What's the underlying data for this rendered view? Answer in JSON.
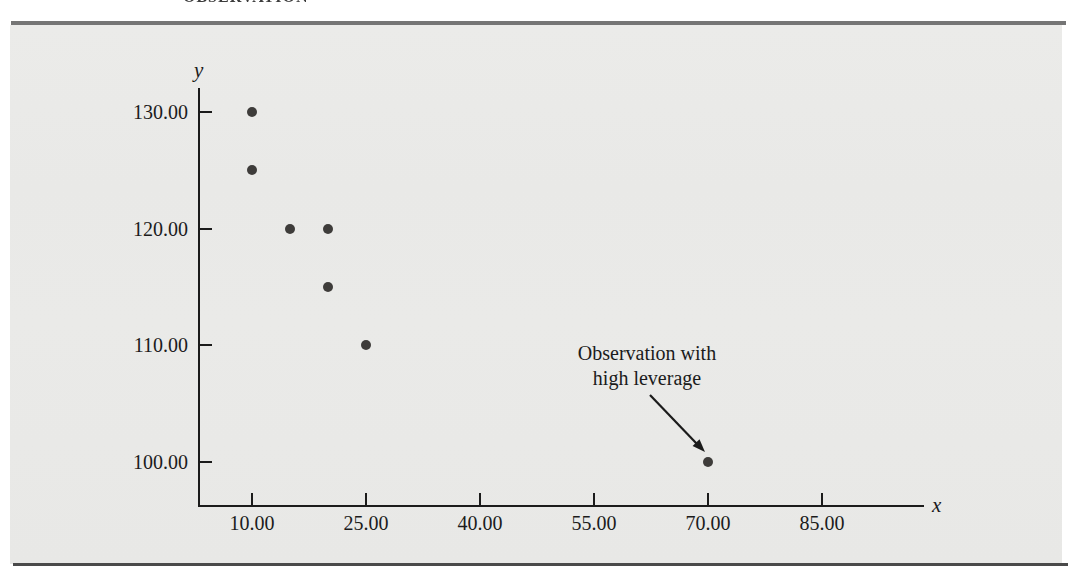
{
  "page": {
    "clipped_header_text": "OBSERVATION"
  },
  "figure": {
    "panel_background_color": "#e9e9e7",
    "top_bar_color": "#757575",
    "bottom_rule_color": "#4a4a4a",
    "axis_color": "#1b1b1b",
    "point_color": "#3e3c3a"
  },
  "chart_data": {
    "type": "scatter",
    "title": "",
    "xlabel": "x",
    "ylabel": "y",
    "grid": false,
    "legend": false,
    "xlim": [
      2,
      97
    ],
    "ylim": [
      96,
      133
    ],
    "x_ticks": [
      {
        "value": 10,
        "label": "10.00"
      },
      {
        "value": 25,
        "label": "25.00"
      },
      {
        "value": 40,
        "label": "40.00"
      },
      {
        "value": 55,
        "label": "55.00"
      },
      {
        "value": 70,
        "label": "70.00"
      },
      {
        "value": 85,
        "label": "85.00"
      }
    ],
    "y_ticks": [
      {
        "value": 100,
        "label": "100.00"
      },
      {
        "value": 110,
        "label": "110.00"
      },
      {
        "value": 120,
        "label": "120.00"
      },
      {
        "value": 130,
        "label": "130.00"
      }
    ],
    "points": [
      {
        "x": 10,
        "y": 130
      },
      {
        "x": 10,
        "y": 125
      },
      {
        "x": 15,
        "y": 120
      },
      {
        "x": 20,
        "y": 120
      },
      {
        "x": 20,
        "y": 115
      },
      {
        "x": 25,
        "y": 110
      },
      {
        "x": 70,
        "y": 100
      }
    ],
    "annotation": {
      "text_line1": "Observation with",
      "text_line2": "high leverage",
      "points_to": {
        "x": 70,
        "y": 100
      }
    }
  }
}
